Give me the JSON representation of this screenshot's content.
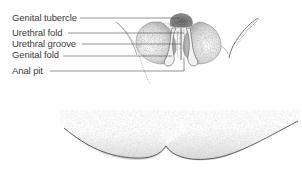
{
  "diagram": {
    "labels": [
      {
        "id": "genital-tubercle",
        "text": "Genital tubercle",
        "y": 12
      },
      {
        "id": "urethral-fold",
        "text": "Urethral fold",
        "y": 27
      },
      {
        "id": "urethral-groove",
        "text": "Urethral groove",
        "y": 38
      },
      {
        "id": "genital-fold",
        "text": "Genital fold",
        "y": 49
      },
      {
        "id": "anal-pit",
        "text": "Anal pit",
        "y": 66
      }
    ],
    "colors": {
      "ink": "#3a3a3a",
      "stipple": "#6b6b6b",
      "leader": "#4a4a4a",
      "background": "#ffffff"
    }
  }
}
